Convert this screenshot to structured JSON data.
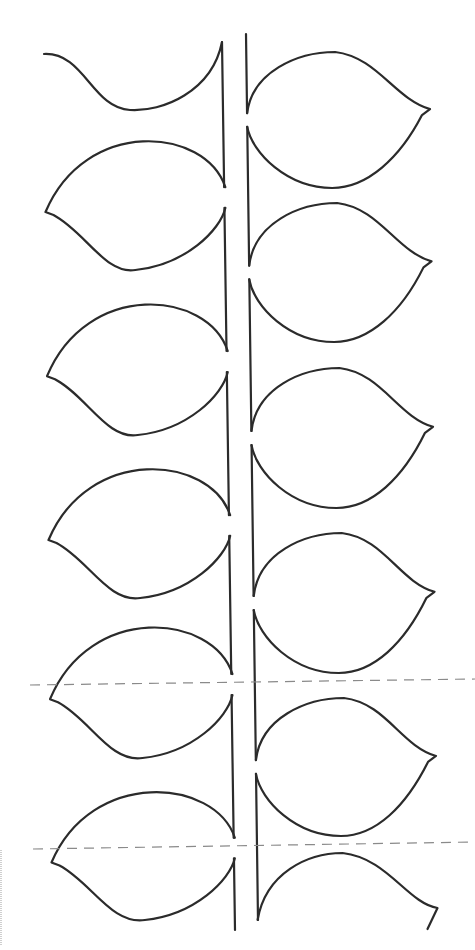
{
  "drawing": {
    "title": "Leaf stem template",
    "stroke_color": "#2b2b2b",
    "cut_line_color": "#8a8a8a",
    "background": "#ffffff"
  },
  "stems": {
    "left": {
      "x_top": 222,
      "y_top": 42,
      "x_bottom": 235,
      "y_bottom": 930,
      "segments": 6
    },
    "right": {
      "x_top": 246,
      "y_top": 34,
      "x_bottom": 258,
      "y_bottom": 920,
      "segments": 6
    }
  },
  "cut_lines": [
    {
      "x1": 30,
      "y1": 685,
      "x2": 475,
      "y2": 679
    },
    {
      "x1": 33,
      "y1": 849,
      "x2": 475,
      "y2": 842
    }
  ],
  "leaves_left": [
    {
      "id": "L1",
      "partial": true,
      "top": 42,
      "bottom": 110
    },
    {
      "id": "L2",
      "top": 132,
      "bottom": 270
    },
    {
      "id": "L3",
      "top": 295,
      "bottom": 435
    },
    {
      "id": "L4",
      "top": 460,
      "bottom": 598
    },
    {
      "id": "L5",
      "top": 618,
      "bottom": 758
    },
    {
      "id": "L6",
      "top": 783,
      "bottom": 920
    }
  ],
  "leaves_right": [
    {
      "id": "R1",
      "top": 52,
      "bottom": 188
    },
    {
      "id": "R2",
      "top": 203,
      "bottom": 342
    },
    {
      "id": "R3",
      "top": 368,
      "bottom": 508
    },
    {
      "id": "R4",
      "top": 533,
      "bottom": 673
    },
    {
      "id": "R5",
      "top": 698,
      "bottom": 836
    },
    {
      "id": "R6",
      "partial": true,
      "top": 853,
      "bottom": 925
    }
  ]
}
